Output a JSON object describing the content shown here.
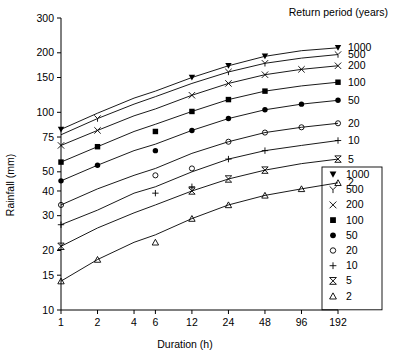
{
  "chart_data": {
    "type": "line",
    "title": "",
    "xlabel": "Duration (h)",
    "ylabel": "Rainfall (mm)",
    "xscale": "log",
    "yscale": "log",
    "x": [
      1,
      2,
      4,
      6,
      12,
      24,
      48,
      96,
      192
    ],
    "xtick_labels": [
      "1",
      "2",
      "4",
      "6",
      "12",
      "24",
      "48",
      "96",
      "192"
    ],
    "ytick_labels": [
      "300",
      "200",
      "150",
      "100",
      "75",
      "50",
      "40",
      "30",
      "20",
      "15",
      "10"
    ],
    "ytick_values": [
      300,
      200,
      150,
      100,
      75,
      50,
      40,
      30,
      20,
      15,
      10
    ],
    "xlim": [
      1,
      192
    ],
    "ylim": [
      10,
      300
    ],
    "grid": false,
    "legend_position": "right",
    "legend_title": "Return period (years)",
    "series": [
      {
        "name": "1000",
        "marker": "filled-triangle-down",
        "values": [
          82,
          99,
          118,
          128,
          150,
          172,
          192,
          205,
          212
        ],
        "x_points": [
          1,
          12,
          24,
          48,
          192
        ],
        "point_values": [
          82,
          150,
          172,
          192,
          212
        ]
      },
      {
        "name": "500",
        "marker": "y-glyph",
        "values": [
          77,
          93,
          110,
          120,
          140,
          160,
          177,
          188,
          196
        ],
        "x_points": [
          2,
          24,
          48,
          192
        ],
        "point_values": [
          93,
          160,
          177,
          196
        ]
      },
      {
        "name": "200",
        "marker": "x-cross",
        "values": [
          68,
          81,
          96,
          104,
          122,
          140,
          155,
          165,
          172
        ],
        "x_points": [
          1,
          2,
          12,
          24,
          48,
          96,
          192
        ],
        "point_values": [
          68,
          81,
          122,
          140,
          155,
          165,
          172
        ]
      },
      {
        "name": "100",
        "marker": "filled-square",
        "values": [
          56,
          67,
          80,
          87,
          101,
          116,
          128,
          136,
          142
        ],
        "x_points": [
          1,
          2,
          6,
          12,
          24,
          48,
          192
        ],
        "point_values": [
          56,
          67,
          80,
          101,
          116,
          128,
          142
        ]
      },
      {
        "name": "50",
        "marker": "filled-circle",
        "values": [
          45,
          54,
          64,
          69,
          81,
          93,
          103,
          110,
          115
        ],
        "x_points": [
          1,
          2,
          6,
          12,
          24,
          48,
          96,
          192
        ],
        "point_values": [
          45,
          54,
          64,
          81,
          93,
          103,
          110,
          115
        ]
      },
      {
        "name": "20",
        "marker": "open-circle",
        "values": [
          34,
          41,
          48,
          52,
          62,
          71,
          79,
          84,
          88
        ],
        "x_points": [
          1,
          6,
          12,
          24,
          48,
          96,
          192
        ],
        "point_values": [
          34,
          48,
          52,
          71,
          79,
          84,
          88
        ]
      },
      {
        "name": "10",
        "marker": "plus",
        "values": [
          27,
          32,
          39,
          42,
          50,
          58,
          64,
          68,
          72
        ],
        "x_points": [
          1,
          6,
          12,
          24,
          48,
          192
        ],
        "point_values": [
          27,
          39,
          42,
          58,
          64,
          72
        ]
      },
      {
        "name": "5",
        "marker": "bowtie",
        "values": [
          21,
          26,
          31,
          34,
          40,
          46,
          51,
          55,
          58
        ],
        "x_points": [
          1,
          12,
          24,
          48,
          192
        ],
        "point_values": [
          21,
          40,
          46,
          51,
          58
        ]
      },
      {
        "name": "2",
        "marker": "open-triangle-up",
        "values": [
          14,
          18,
          22,
          24,
          29,
          34,
          38,
          41,
          44
        ],
        "x_points": [
          1,
          2,
          6,
          12,
          24,
          48,
          96,
          192
        ],
        "point_values": [
          14,
          18,
          22,
          29,
          34,
          38,
          41,
          44
        ]
      }
    ],
    "right_labels": [
      "1000",
      "500",
      "200",
      "100",
      "50",
      "20",
      "10",
      "5",
      "2"
    ],
    "legend_entries": [
      {
        "marker": "filled-triangle-down",
        "label": "1000"
      },
      {
        "marker": "y-glyph",
        "label": "500"
      },
      {
        "marker": "x-cross",
        "label": "200"
      },
      {
        "marker": "filled-square",
        "label": "100"
      },
      {
        "marker": "filled-circle",
        "label": "50"
      },
      {
        "marker": "open-circle",
        "label": "20"
      },
      {
        "marker": "plus",
        "label": "10"
      },
      {
        "marker": "bowtie",
        "label": "5"
      },
      {
        "marker": "open-triangle-up",
        "label": "2"
      }
    ]
  }
}
